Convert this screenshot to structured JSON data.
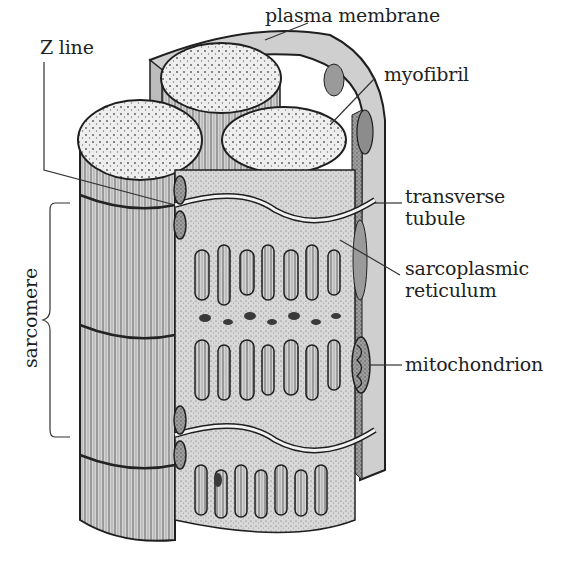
{
  "diagram": {
    "labels": {
      "plasma_membrane": "plasma membrane",
      "myofibril": "myofibril",
      "z_line": "Z line",
      "transverse_tubule_1": "transverse",
      "transverse_tubule_2": "tubule",
      "sarcoplasmic_reticulum_1": "sarcoplasmic",
      "sarcoplasmic_reticulum_2": "reticulum",
      "mitochondrion": "mitochondrion",
      "sarcomere": "sarcomere"
    },
    "colors": {
      "ink": "#1f1f1f",
      "light_fill": "#ececec",
      "mid_fill": "#bdbdbd",
      "dark_fill": "#8a8a8a",
      "background": "#ffffff"
    }
  }
}
